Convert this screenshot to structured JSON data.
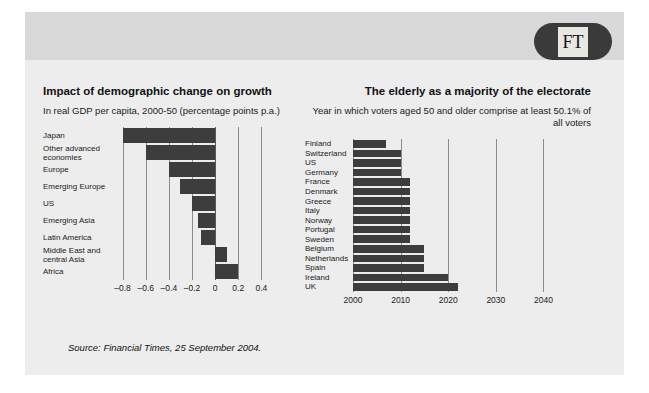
{
  "brand": {
    "logo_text": "FT",
    "logo_color": "#3a3a3a",
    "logo_badge_color": "#e9e7e2"
  },
  "source": {
    "text": "Source: Financial Times, 25 September 2004."
  },
  "colors": {
    "panel_background": "#ededed",
    "header_band": "#d9d9d9",
    "bar": "#3d3d3d",
    "gridline": "#8c8c8c"
  },
  "chart_data": [
    {
      "id": "left",
      "type": "bar",
      "orientation": "horizontal",
      "title": "Impact of demographic change on growth",
      "subtitle": "In real GDP per capita, 2000-50 (percentage points p.a.)",
      "xlabel": "",
      "ylabel": "",
      "xlim": [
        -0.9,
        0.5
      ],
      "xticks": [
        -0.8,
        -0.6,
        -0.4,
        -0.2,
        0,
        0.2,
        0.4
      ],
      "xticklabels": [
        "–0.8",
        "–0.6",
        "–0.4",
        "–0.2",
        "0",
        "0.2",
        "0.4"
      ],
      "grid": true,
      "legend": false,
      "categories": [
        "Japan",
        "Other advanced\neconomies",
        "Europe",
        "Emerging Europe",
        "US",
        "Emerging Asia",
        "Latin America",
        "Middle East and\ncentral Asia",
        "Africa"
      ],
      "values": [
        -0.8,
        -0.6,
        -0.4,
        -0.3,
        -0.2,
        -0.15,
        -0.12,
        0.1,
        0.2
      ]
    },
    {
      "id": "right",
      "type": "bar",
      "orientation": "horizontal",
      "title": "The elderly as a majority of the electorate",
      "subtitle": "Year in which voters aged 50 and older comprise at least 50.1% of all voters",
      "xlabel": "",
      "ylabel": "",
      "xlim": [
        2000,
        2042
      ],
      "xticks": [
        2000,
        2010,
        2020,
        2030,
        2040
      ],
      "xticklabels": [
        "2000",
        "2010",
        "2020",
        "2030",
        "2040"
      ],
      "grid": true,
      "legend": false,
      "baseline": 2000,
      "categories": [
        "Finland",
        "Switzerland",
        "US",
        "Germany",
        "France",
        "Denmark",
        "Greece",
        "Italy",
        "Norway",
        "Portugal",
        "Sweden",
        "Belgium",
        "Netherlands",
        "Spain",
        "Ireland",
        "UK"
      ],
      "values": [
        2007,
        2010,
        2010,
        2010,
        2012,
        2012,
        2012,
        2012,
        2012,
        2012,
        2012,
        2015,
        2015,
        2015,
        2020,
        2022
      ]
    }
  ]
}
